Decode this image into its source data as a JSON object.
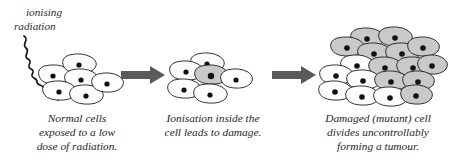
{
  "diagram": {
    "background_color": "#ffffff",
    "width": 453,
    "height": 163,
    "radiation_label": {
      "line1": "ionising",
      "line2": "radiation",
      "color": "#2b2b2b",
      "style": "italic"
    },
    "colors": {
      "normal_cell_fill": "#fdfdfd",
      "damaged_cell_fill": "#c9c9c9",
      "cell_outline": "#1f1f1f",
      "nucleus": "#111111",
      "arrow": "#5a5a5a",
      "text": "#262626",
      "ray": "#121212"
    },
    "stages": [
      {
        "id": "stage-normal",
        "caption_lines": [
          "Normal cells",
          "exposed to a low",
          "dose of radiation."
        ],
        "caption_full": "Normal cells exposed to a low dose of radiation.",
        "normal_cell_count": 6,
        "damaged_cell_count": 0,
        "has_radiation_ray": true
      },
      {
        "id": "stage-ionisation",
        "caption_lines": [
          "Ionisation inside the",
          "cell leads to damage."
        ],
        "caption_full": "Ionisation inside the cell leads to damage.",
        "normal_cell_count": 5,
        "damaged_cell_count": 1,
        "has_radiation_ray": false
      },
      {
        "id": "stage-tumour",
        "caption_lines": [
          "Damaged (mutant) cell",
          "divides uncontrollably",
          "forming a tumour."
        ],
        "caption_full": "Damaged (mutant) cell divides uncontrollably forming a tumour.",
        "normal_cell_count": 8,
        "damaged_cell_count": 13,
        "has_radiation_ray": false
      }
    ],
    "arrows": [
      {
        "id": "arrow-1",
        "direction": "right",
        "from": "stage-normal",
        "to": "stage-ionisation"
      },
      {
        "id": "arrow-2",
        "direction": "right",
        "from": "stage-ionisation",
        "to": "stage-tumour"
      }
    ]
  }
}
